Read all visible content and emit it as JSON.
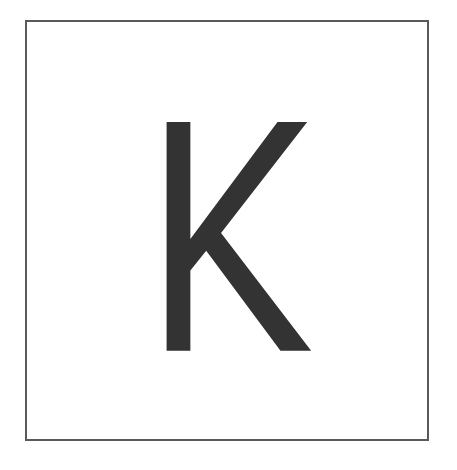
{
  "card": {
    "letter": "K",
    "letter_color": "#333333",
    "border_color": "#5a5a5a",
    "background_color": "#ffffff"
  }
}
